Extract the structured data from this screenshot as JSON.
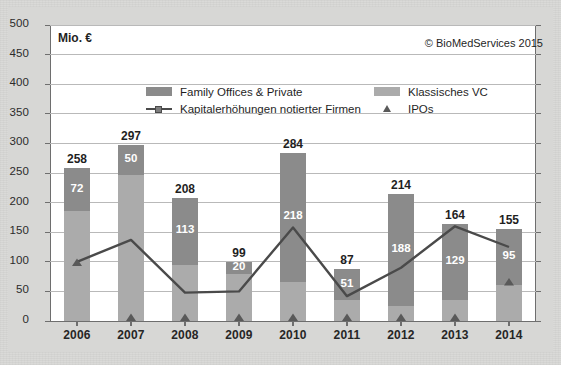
{
  "credit": "© BioMedServices 2015",
  "axis_unit_label": "Mio. €",
  "legend": {
    "items": [
      {
        "label": "Family Offices & Private",
        "marker": "box-dark",
        "color": "#8b8b8b"
      },
      {
        "label": "Klassisches VC",
        "marker": "box-light",
        "color": "#ababab"
      },
      {
        "label": "Kapitalerhöhungen notierter Firmen",
        "marker": "line-square",
        "color": "#4a4a4a"
      },
      {
        "label": "IPOs",
        "marker": "triangle",
        "color": "#595959"
      }
    ]
  },
  "chart_data": {
    "type": "bar",
    "title": "",
    "subtitle": "",
    "xlabel": "",
    "ylabel": "Mio. €",
    "ylim": [
      0,
      500
    ],
    "yticks": [
      0,
      50,
      100,
      150,
      200,
      250,
      300,
      350,
      400,
      450,
      500
    ],
    "ytick_labels": [
      "0",
      "50",
      "100",
      "150",
      "200",
      "250",
      "300",
      "350",
      "400",
      "450",
      "500"
    ],
    "grid": true,
    "legend_position": "top-center",
    "categories": [
      "2006",
      "2007",
      "2008",
      "2009",
      "2010",
      "2011",
      "2012",
      "2013",
      "2014"
    ],
    "totals": [
      258,
      297,
      208,
      99,
      284,
      87,
      214,
      164,
      155
    ],
    "series": [
      {
        "name": "Family Offices & Private",
        "type": "bar-stacked-top",
        "color": "#8b8b8b",
        "values": [
          72,
          50,
          113,
          20,
          218,
          51,
          188,
          129,
          95
        ]
      },
      {
        "name": "Klassisches VC",
        "type": "bar-stacked-bottom",
        "color": "#ababab",
        "values": [
          186,
          247,
          95,
          79,
          66,
          36,
          26,
          35,
          60
        ]
      },
      {
        "name": "Kapitalerhöhungen notierter Firmen",
        "type": "line",
        "color": "#4a4a4a",
        "values": [
          100,
          137,
          48,
          50,
          158,
          42,
          90,
          160,
          125
        ]
      },
      {
        "name": "IPOs",
        "type": "scatter-triangle",
        "color": "#595959",
        "values": [
          93,
          0,
          0,
          0,
          0,
          0,
          0,
          0,
          60
        ]
      }
    ]
  }
}
